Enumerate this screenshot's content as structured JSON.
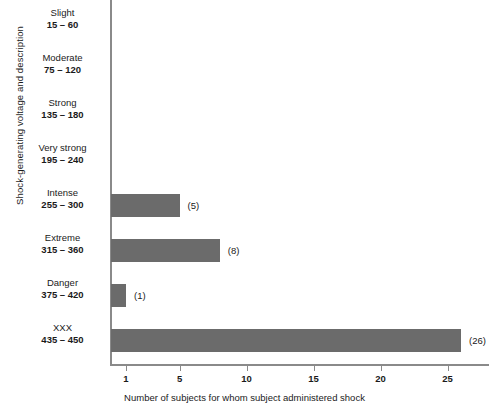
{
  "chart_data": {
    "type": "bar",
    "orientation": "horizontal",
    "title": "",
    "xlabel": "Number of subjects for whom subject administered shock",
    "ylabel": "Shock-generating voltage and description",
    "categories": [
      "Slight",
      "Moderate",
      "Strong",
      "Very strong",
      "Intense",
      "Extreme",
      "Danger",
      "XXX"
    ],
    "category_ranges": [
      "15 – 60",
      "75 – 120",
      "135 – 180",
      "195 – 240",
      "255 – 300",
      "315 – 360",
      "375 – 420",
      "435 – 450"
    ],
    "values": [
      0,
      0,
      0,
      0,
      5,
      8,
      1,
      26
    ],
    "value_labels": [
      "",
      "",
      "",
      "",
      "(5)",
      "(8)",
      "(1)",
      "(26)"
    ],
    "xticks": [
      1,
      5,
      10,
      15,
      20,
      25
    ],
    "xtick_labels": [
      "1",
      "5",
      "10",
      "15",
      "20",
      "25"
    ],
    "xlim": [
      0,
      28.4
    ],
    "grid": false,
    "legend": false,
    "bar_color": "#6b6b6b",
    "axis_color": "#8a8a8a",
    "background_color": "#ffffff"
  }
}
